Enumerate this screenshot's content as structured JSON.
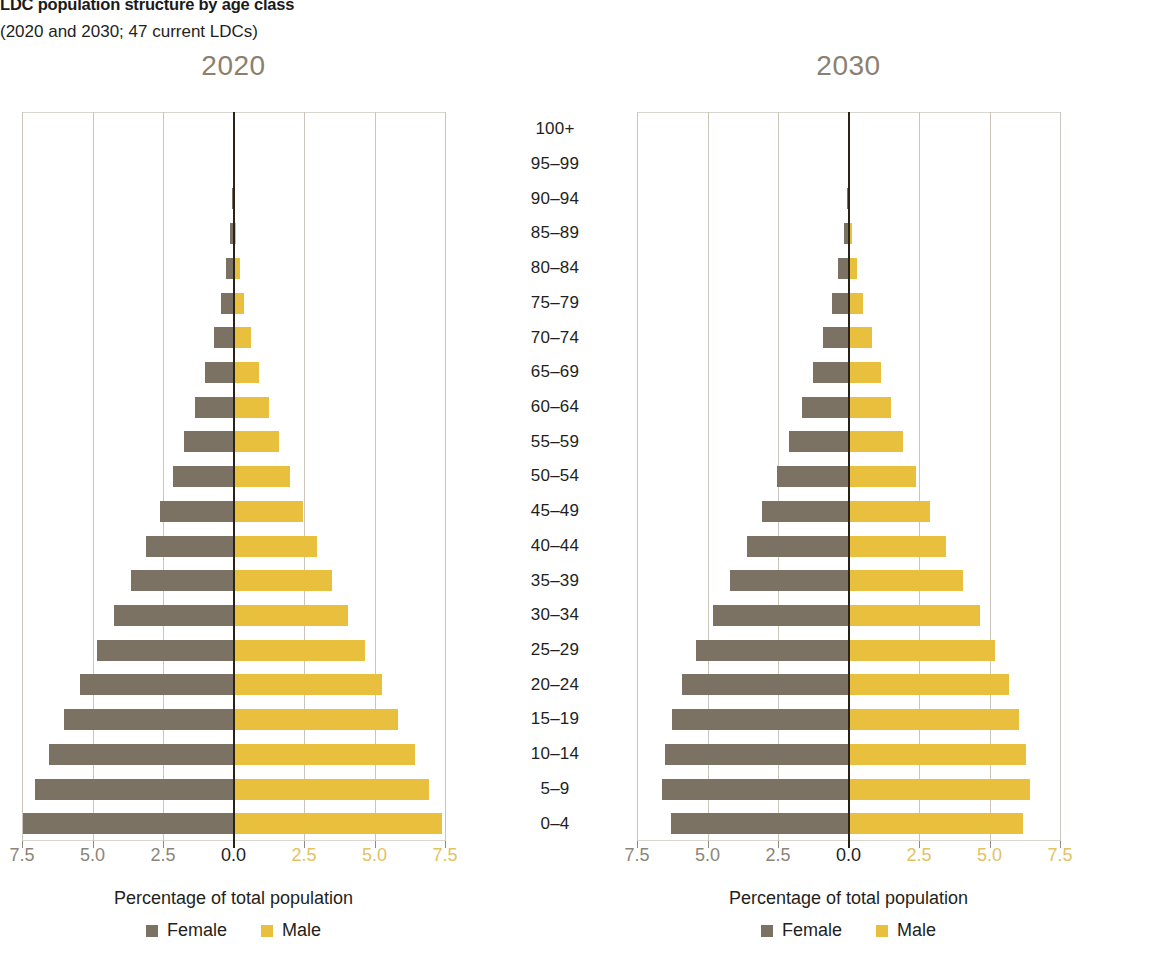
{
  "header": {
    "title": "LDC population structure by age class",
    "subtitle": "(2020 and 2030; 47 current LDCs)"
  },
  "colors": {
    "female": "#7c7263",
    "male": "#e8c03e",
    "panel_title": "#8b8070",
    "zero_axis": "#2b2318",
    "gridline": "#c9c5bb"
  },
  "legend": {
    "female_label": "Female",
    "male_label": "Male"
  },
  "axis": {
    "x_title": "Percentage of total population",
    "tick_labels": [
      "7.5",
      "5.0",
      "2.5",
      "0.0",
      "2.5",
      "5.0",
      "7.5"
    ],
    "tick_values": [
      -7.5,
      -5.0,
      -2.5,
      0.0,
      2.5,
      5.0,
      7.5
    ]
  },
  "chart_data": {
    "type": "bar",
    "title": "LDC population structure by age class",
    "subtitle": "(2020 and 2030; 47 current LDCs)",
    "xlabel": "Percentage of total population",
    "ylabel": "",
    "xlim": [
      -7.5,
      7.5
    ],
    "grid": true,
    "legend_position": "bottom",
    "legend_entries": [
      "Female",
      "Male"
    ],
    "categories": [
      "100+",
      "95–99",
      "90–94",
      "85–89",
      "80–84",
      "75–79",
      "70–74",
      "65–69",
      "60–64",
      "55–59",
      "50–54",
      "45–49",
      "40–44",
      "35–39",
      "30–34",
      "25–29",
      "20–24",
      "15–19",
      "10–14",
      "5–9",
      "0–4"
    ],
    "panels": [
      {
        "name": "2020",
        "title": "2020",
        "series": [
          {
            "name": "Female",
            "color": "#7c7263",
            "side": "left",
            "values": [
              0.0,
              0.01,
              0.04,
              0.12,
              0.28,
              0.45,
              0.7,
              1.0,
              1.35,
              1.75,
              2.15,
              2.6,
              3.1,
              3.65,
              4.25,
              4.85,
              5.45,
              6.0,
              6.55,
              7.05,
              7.45
            ]
          },
          {
            "name": "Male",
            "color": "#e8c03e",
            "side": "right",
            "values": [
              0.0,
              0.01,
              0.03,
              0.09,
              0.22,
              0.38,
              0.62,
              0.92,
              1.25,
              1.62,
              2.0,
              2.45,
              2.95,
              3.5,
              4.05,
              4.65,
              5.25,
              5.85,
              6.45,
              6.95,
              7.4
            ]
          }
        ]
      },
      {
        "name": "2030",
        "title": "2030",
        "series": [
          {
            "name": "Female",
            "color": "#7c7263",
            "side": "left",
            "values": [
              0.0,
              0.02,
              0.06,
              0.16,
              0.36,
              0.6,
              0.92,
              1.25,
              1.65,
              2.1,
              2.55,
              3.05,
              3.6,
              4.2,
              4.8,
              5.4,
              5.9,
              6.25,
              6.5,
              6.6,
              6.3
            ]
          },
          {
            "name": "Male",
            "color": "#e8c03e",
            "side": "right",
            "values": [
              0.0,
              0.01,
              0.04,
              0.12,
              0.3,
              0.52,
              0.82,
              1.15,
              1.52,
              1.95,
              2.4,
              2.9,
              3.45,
              4.05,
              4.65,
              5.2,
              5.7,
              6.05,
              6.3,
              6.45,
              6.2
            ]
          }
        ]
      }
    ]
  }
}
